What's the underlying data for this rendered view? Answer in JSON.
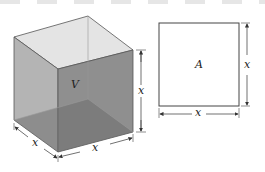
{
  "figure": {
    "cube": {
      "volume_label": "V",
      "edge_label_height": "x",
      "edge_label_depth": "x",
      "edge_label_width": "x"
    },
    "square": {
      "area_label": "A",
      "side_label_right": "x",
      "side_label_bottom": "x"
    },
    "colors": {
      "cube_left_face": "#b4b4b4",
      "cube_front_face": "#8a8a8a",
      "cube_top_face": "#e4e4e4",
      "cube_floor": "#6e6e6e",
      "outline": "#333333"
    }
  }
}
